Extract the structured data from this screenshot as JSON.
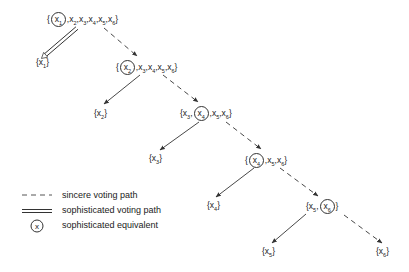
{
  "diagram": {
    "type": "voting tree",
    "nodes": [
      {
        "id": "root",
        "left": "{",
        "items": [
          {
            "t": "x",
            "s": "1",
            "circled": true
          },
          {
            "t": "x",
            "s": "2"
          },
          {
            "t": "x",
            "s": "3"
          },
          {
            "t": "x",
            "s": "4"
          },
          {
            "t": "x",
            "s": "5"
          },
          {
            "t": "x",
            "s": "6"
          }
        ],
        "right": "}",
        "x": 47,
        "y": 12
      },
      {
        "id": "n1",
        "left": "{",
        "items": [
          {
            "t": "x",
            "s": "1"
          }
        ],
        "right": "}",
        "x": 36,
        "y": 56
      },
      {
        "id": "n2",
        "left": "{",
        "items": [
          {
            "t": "x",
            "s": "2",
            "circled": true
          },
          {
            "t": "x",
            "s": "3"
          },
          {
            "t": "x",
            "s": "4"
          },
          {
            "t": "x",
            "s": "5"
          },
          {
            "t": "x",
            "s": "6"
          }
        ],
        "right": "}",
        "x": 116,
        "y": 60
      },
      {
        "id": "n2leaf",
        "left": "{",
        "items": [
          {
            "t": "x",
            "s": "2"
          }
        ],
        "right": "}",
        "x": 94,
        "y": 107
      },
      {
        "id": "n3",
        "left": "{",
        "items": [
          {
            "t": "x",
            "s": "3"
          },
          {
            "t": "x",
            "s": "4",
            "circled": true
          },
          {
            "t": "x",
            "s": "5"
          },
          {
            "t": "x",
            "s": "6"
          }
        ],
        "right": "}",
        "x": 180,
        "y": 106
      },
      {
        "id": "n3leaf",
        "left": "{",
        "items": [
          {
            "t": "x",
            "s": "3"
          }
        ],
        "right": "}",
        "x": 149,
        "y": 152
      },
      {
        "id": "n4",
        "left": "{",
        "items": [
          {
            "t": "x",
            "s": "4",
            "circled": true
          },
          {
            "t": "x",
            "s": "5"
          },
          {
            "t": "x",
            "s": "6"
          }
        ],
        "right": "}",
        "x": 245,
        "y": 153
      },
      {
        "id": "n4leaf",
        "left": "{",
        "items": [
          {
            "t": "x",
            "s": "4"
          }
        ],
        "right": "}",
        "x": 207,
        "y": 199
      },
      {
        "id": "n5",
        "left": "{",
        "items": [
          {
            "t": "x",
            "s": "5"
          },
          {
            "t": "x",
            "s": "6",
            "circled": true
          }
        ],
        "right": "}",
        "x": 306,
        "y": 199
      },
      {
        "id": "n5leaf",
        "left": "{",
        "items": [
          {
            "t": "x",
            "s": "5"
          }
        ],
        "right": "}",
        "x": 262,
        "y": 245
      },
      {
        "id": "n6leaf",
        "left": "{",
        "items": [
          {
            "t": "x",
            "s": "6"
          }
        ],
        "right": "}",
        "x": 376,
        "y": 245
      }
    ],
    "edges": [
      {
        "from": "root",
        "to": "n1",
        "style": "double",
        "x1": 77,
        "y1": 28,
        "x2": 42,
        "y2": 58
      },
      {
        "from": "root",
        "to": "n2",
        "style": "dashed",
        "x1": 104,
        "y1": 28,
        "x2": 137,
        "y2": 56
      },
      {
        "from": "n2",
        "to": "n2leaf",
        "style": "solid",
        "x1": 140,
        "y1": 75,
        "x2": 104,
        "y2": 104
      },
      {
        "from": "n2",
        "to": "n3",
        "style": "dashed",
        "x1": 163,
        "y1": 75,
        "x2": 198,
        "y2": 102
      },
      {
        "from": "n3",
        "to": "n3leaf",
        "style": "solid",
        "x1": 199,
        "y1": 122,
        "x2": 160,
        "y2": 150
      },
      {
        "from": "n3",
        "to": "n4",
        "style": "dashed",
        "x1": 226,
        "y1": 122,
        "x2": 261,
        "y2": 149
      },
      {
        "from": "n4",
        "to": "n4leaf",
        "style": "solid",
        "x1": 254,
        "y1": 168,
        "x2": 216,
        "y2": 197
      },
      {
        "from": "n4",
        "to": "n5",
        "style": "dashed",
        "x1": 280,
        "y1": 168,
        "x2": 318,
        "y2": 196
      },
      {
        "from": "n5",
        "to": "n5leaf",
        "style": "solid",
        "x1": 306,
        "y1": 214,
        "x2": 272,
        "y2": 243
      },
      {
        "from": "n5",
        "to": "n6leaf",
        "style": "dashed",
        "x1": 344,
        "y1": 215,
        "x2": 382,
        "y2": 243
      }
    ]
  },
  "legend": {
    "items": [
      {
        "symbol": "dashed-line",
        "label": "sincere voting path"
      },
      {
        "symbol": "double-line",
        "label": "sophisticated voting path"
      },
      {
        "symbol": "circled-x",
        "glyph": "x",
        "label": "sophisticated equivalent"
      }
    ]
  },
  "colors": {
    "line": "#333333",
    "text": "#222222",
    "background": "#ffffff"
  }
}
